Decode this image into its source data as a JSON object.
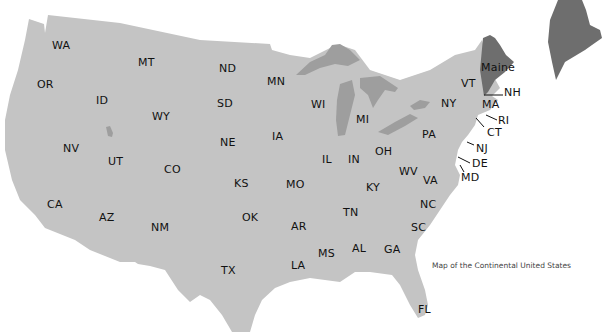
{
  "map": {
    "caption": "Map of the Continental United States",
    "colors": {
      "land": "#c4c4c4",
      "water": "#9e9e9e",
      "highlight": "#6e6e6e",
      "background": "#ffffff",
      "label": "#111111"
    },
    "highlighted_state": "Maine",
    "inset": {
      "state": "Maine",
      "color": "#6e6e6e"
    },
    "labels": [
      {
        "id": "WA",
        "text": "WA",
        "x": 52,
        "y": 40
      },
      {
        "id": "MT",
        "text": "MT",
        "x": 138,
        "y": 57
      },
      {
        "id": "ND",
        "text": "ND",
        "x": 219,
        "y": 63
      },
      {
        "id": "MN",
        "text": "MN",
        "x": 267,
        "y": 76
      },
      {
        "id": "OR",
        "text": "OR",
        "x": 37,
        "y": 79
      },
      {
        "id": "ID",
        "text": "ID",
        "x": 96,
        "y": 95
      },
      {
        "id": "SD",
        "text": "SD",
        "x": 217,
        "y": 98
      },
      {
        "id": "WI",
        "text": "WI",
        "x": 311,
        "y": 99
      },
      {
        "id": "WY",
        "text": "WY",
        "x": 152,
        "y": 111
      },
      {
        "id": "MI",
        "text": "MI",
        "x": 356,
        "y": 114
      },
      {
        "id": "IA",
        "text": "IA",
        "x": 272,
        "y": 131
      },
      {
        "id": "NE",
        "text": "NE",
        "x": 220,
        "y": 137
      },
      {
        "id": "NV",
        "text": "NV",
        "x": 63,
        "y": 143
      },
      {
        "id": "UT",
        "text": "UT",
        "x": 108,
        "y": 156
      },
      {
        "id": "IL",
        "text": "IL",
        "x": 322,
        "y": 154
      },
      {
        "id": "IN",
        "text": "IN",
        "x": 348,
        "y": 154
      },
      {
        "id": "OH",
        "text": "OH",
        "x": 375,
        "y": 146
      },
      {
        "id": "CO",
        "text": "CO",
        "x": 164,
        "y": 164
      },
      {
        "id": "WV",
        "text": "WV",
        "x": 399,
        "y": 166
      },
      {
        "id": "VA",
        "text": "VA",
        "x": 423,
        "y": 175
      },
      {
        "id": "KS",
        "text": "KS",
        "x": 234,
        "y": 178
      },
      {
        "id": "MO",
        "text": "MO",
        "x": 286,
        "y": 179
      },
      {
        "id": "KY",
        "text": "KY",
        "x": 366,
        "y": 182
      },
      {
        "id": "CA",
        "text": "CA",
        "x": 47,
        "y": 199
      },
      {
        "id": "OK",
        "text": "OK",
        "x": 242,
        "y": 212
      },
      {
        "id": "TN",
        "text": "TN",
        "x": 343,
        "y": 207
      },
      {
        "id": "NC",
        "text": "NC",
        "x": 420,
        "y": 199
      },
      {
        "id": "AZ",
        "text": "AZ",
        "x": 99,
        "y": 212
      },
      {
        "id": "NM",
        "text": "NM",
        "x": 151,
        "y": 222
      },
      {
        "id": "AR",
        "text": "AR",
        "x": 291,
        "y": 221
      },
      {
        "id": "SC",
        "text": "SC",
        "x": 411,
        "y": 222
      },
      {
        "id": "MS",
        "text": "MS",
        "x": 318,
        "y": 248
      },
      {
        "id": "AL",
        "text": "AL",
        "x": 352,
        "y": 243
      },
      {
        "id": "GA",
        "text": "GA",
        "x": 384,
        "y": 244
      },
      {
        "id": "LA",
        "text": "LA",
        "x": 291,
        "y": 260
      },
      {
        "id": "TX",
        "text": "TX",
        "x": 221,
        "y": 265
      },
      {
        "id": "FL",
        "text": "FL",
        "x": 418,
        "y": 304
      },
      {
        "id": "Maine",
        "text": "Maine",
        "x": 481,
        "y": 62
      },
      {
        "id": "VT",
        "text": "VT",
        "x": 461,
        "y": 78
      },
      {
        "id": "NH",
        "text": "NH",
        "x": 504,
        "y": 87
      },
      {
        "id": "NY",
        "text": "NY",
        "x": 441,
        "y": 98
      },
      {
        "id": "MA",
        "text": "MA",
        "x": 482,
        "y": 99
      },
      {
        "id": "RI",
        "text": "RI",
        "x": 498,
        "y": 115
      },
      {
        "id": "PA",
        "text": "PA",
        "x": 422,
        "y": 129
      },
      {
        "id": "CT",
        "text": "CT",
        "x": 487,
        "y": 127
      },
      {
        "id": "NJ",
        "text": "NJ",
        "x": 476,
        "y": 143
      },
      {
        "id": "DE",
        "text": "DE",
        "x": 472,
        "y": 158
      },
      {
        "id": "MD",
        "text": "MD",
        "x": 461,
        "y": 172
      }
    ]
  }
}
